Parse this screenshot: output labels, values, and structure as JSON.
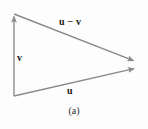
{
  "figure": {
    "caption": "(a)",
    "background_color": "#fdfdfd",
    "stroke_color": "#8a8a8a",
    "label_color": "#1a1a1a",
    "width": 148,
    "height": 129
  },
  "labels": {
    "u_minus_v": "u − v",
    "v": "v",
    "u": "u"
  },
  "vectors": [
    {
      "name": "v",
      "label": "v",
      "from": [
        14,
        96
      ],
      "to": [
        14,
        14
      ],
      "arrowhead_at": "to",
      "label_position": [
        17,
        53
      ]
    },
    {
      "name": "u",
      "label": "u",
      "from": [
        14,
        96
      ],
      "to": [
        137,
        68
      ],
      "arrowhead_at": "to",
      "label_position": [
        67,
        86
      ]
    },
    {
      "name": "u-minus-v",
      "label": "u − v",
      "from": [
        14,
        14
      ],
      "to": [
        137,
        62
      ],
      "arrowhead_at": "to",
      "label_position": [
        59,
        17
      ]
    }
  ],
  "vertices": [
    {
      "name": "top-left",
      "x": 14,
      "y": 14
    },
    {
      "name": "bottom-left",
      "x": 14,
      "y": 96
    },
    {
      "name": "right",
      "x": 137,
      "y": 65
    }
  ]
}
